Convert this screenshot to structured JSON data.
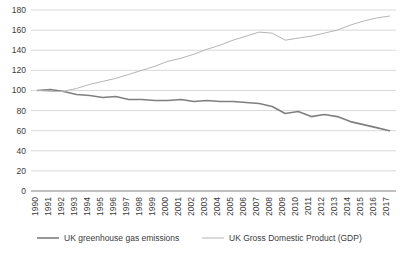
{
  "chart_data": {
    "type": "line",
    "title": "",
    "subtitle": "",
    "xlabel": "",
    "ylabel": "",
    "ylim": [
      0,
      180
    ],
    "ytick_step": 20,
    "yticks": [
      0,
      20,
      40,
      60,
      80,
      100,
      120,
      140,
      160,
      180
    ],
    "grid": true,
    "legend_position": "bottom",
    "categories": [
      "1990",
      "1991",
      "1992",
      "1993",
      "1994",
      "1995",
      "1996",
      "1997",
      "1998",
      "1999",
      "2000",
      "2001",
      "2002",
      "2003",
      "2004",
      "2005",
      "2006",
      "2007",
      "2008",
      "2009",
      "2010",
      "2011",
      "2012",
      "2013",
      "2014",
      "2015",
      "2016",
      "2017"
    ],
    "series": [
      {
        "name": "UK greenhouse gas emissions",
        "color": "#7f7f7f",
        "width": 1.6,
        "values": [
          100,
          101,
          99,
          96,
          95,
          93,
          94,
          91,
          91,
          90,
          90,
          91,
          89,
          90,
          89,
          89,
          88,
          87,
          84,
          77,
          79,
          74,
          76,
          74,
          69,
          66,
          63,
          60
        ]
      },
      {
        "name": "UK Gross Domestic Product (GDP)",
        "color": "#b5b5b5",
        "width": 1.0,
        "values": [
          100,
          99,
          99,
          102,
          106,
          109,
          112,
          116,
          120,
          124,
          129,
          132,
          136,
          141,
          145,
          150,
          154,
          158,
          157,
          150,
          152,
          154,
          157,
          160,
          165,
          169,
          172,
          174
        ]
      }
    ]
  },
  "legend": {
    "items": [
      {
        "label": "UK greenhouse gas emissions",
        "color": "#7f7f7f"
      },
      {
        "label": "UK Gross Domestic Product (GDP)",
        "color": "#b5b5b5"
      }
    ]
  }
}
